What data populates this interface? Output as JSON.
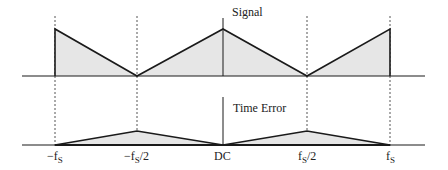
{
  "diagram": {
    "panels": [
      {
        "id": "signal",
        "title": "Signal"
      },
      {
        "id": "time-error",
        "title": "Time Error"
      }
    ],
    "axis_labels": [
      {
        "id": "neg-fs",
        "main": "−f",
        "sub": "S",
        "suffix": ""
      },
      {
        "id": "neg-half-fs",
        "main": "−f",
        "sub": "S",
        "suffix": "/2"
      },
      {
        "id": "dc",
        "main": "DC",
        "sub": "",
        "suffix": ""
      },
      {
        "id": "half-fs",
        "main": "f",
        "sub": "S",
        "suffix": "/2"
      },
      {
        "id": "fs",
        "main": "f",
        "sub": "S",
        "suffix": ""
      }
    ],
    "colors": {
      "line": "#1a1a1a",
      "fill": "#e6e6e6",
      "dashed": "#555555"
    }
  }
}
